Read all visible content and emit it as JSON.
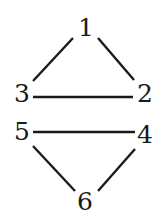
{
  "diagram": {
    "type": "graph",
    "nodes": [
      {
        "id": "1",
        "label": "1",
        "x": 86,
        "y": 27
      },
      {
        "id": "2",
        "label": "2",
        "x": 145,
        "y": 93
      },
      {
        "id": "3",
        "label": "3",
        "x": 22,
        "y": 93
      },
      {
        "id": "4",
        "label": "4",
        "x": 145,
        "y": 134
      },
      {
        "id": "5",
        "label": "5",
        "x": 22,
        "y": 131
      },
      {
        "id": "6",
        "label": "6",
        "x": 85,
        "y": 201
      }
    ],
    "edges": [
      {
        "from": "1",
        "to": "3",
        "x1": 73,
        "y1": 38,
        "x2": 33,
        "y2": 81
      },
      {
        "from": "1",
        "to": "2",
        "x1": 98,
        "y1": 38,
        "x2": 134,
        "y2": 80
      },
      {
        "from": "3",
        "to": "2",
        "x1": 33,
        "y1": 97,
        "x2": 133,
        "y2": 97
      },
      {
        "from": "5",
        "to": "4",
        "x1": 33,
        "y1": 132,
        "x2": 135,
        "y2": 132
      },
      {
        "from": "5",
        "to": "6",
        "x1": 33,
        "y1": 146,
        "x2": 75,
        "y2": 191
      },
      {
        "from": "4",
        "to": "6",
        "x1": 135,
        "y1": 149,
        "x2": 98,
        "y2": 191
      }
    ]
  }
}
